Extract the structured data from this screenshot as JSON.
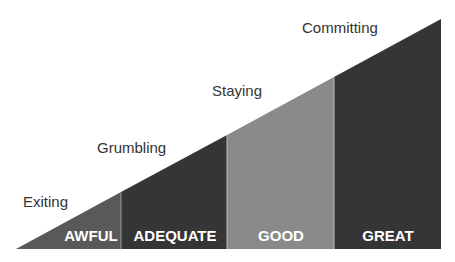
{
  "diagram": {
    "type": "staircase-triangle",
    "segments": [
      {
        "label": "AWFUL",
        "color": "#595959",
        "stage": "Exiting"
      },
      {
        "label": "ADEQUATE",
        "color": "#353535",
        "stage": "Grumbling"
      },
      {
        "label": "GOOD",
        "color": "#8a8a8a",
        "stage": "Staying"
      },
      {
        "label": "GREAT",
        "color": "#353535",
        "stage": "Committing"
      }
    ],
    "stages": [
      "Exiting",
      "Grumbling",
      "Staying",
      "Committing"
    ]
  }
}
